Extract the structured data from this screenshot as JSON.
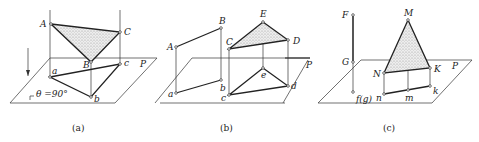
{
  "figure": {
    "panels": [
      {
        "caption": "(a)",
        "plane_label": "P",
        "angle_label": "θ =90°",
        "points_upper": [
          "A",
          "B",
          "C"
        ],
        "points_lower": [
          "a",
          "b",
          "c"
        ]
      },
      {
        "caption": "(b)",
        "plane_label": "P",
        "points_upper": [
          "A",
          "B",
          "C",
          "D",
          "E"
        ],
        "points_lower": [
          "a",
          "b",
          "c",
          "d",
          "e"
        ]
      },
      {
        "caption": "(c)",
        "plane_label": "P",
        "points_upper": [
          "F",
          "G",
          "M",
          "N",
          "K"
        ],
        "points_lower": [
          "f(g)",
          "n",
          "m",
          "k"
        ]
      }
    ]
  }
}
